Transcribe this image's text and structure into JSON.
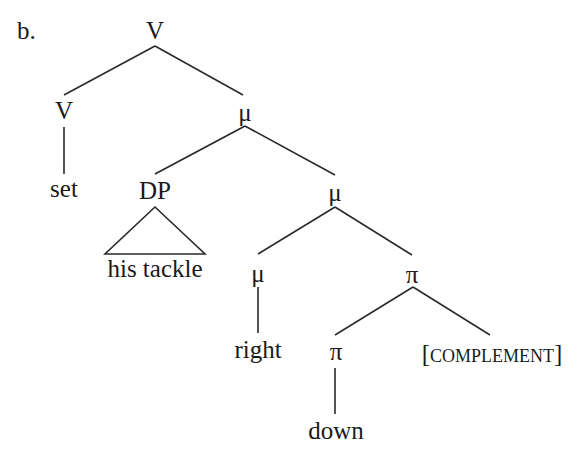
{
  "example_label": "b.",
  "tree": {
    "root": {
      "label": "V"
    },
    "v_head": {
      "label": "V",
      "word": "set"
    },
    "mu1": {
      "label": "μ"
    },
    "dp": {
      "label": "DP",
      "content": "his tackle"
    },
    "mu2": {
      "label": "μ"
    },
    "mu3": {
      "label": "μ",
      "word": "right"
    },
    "pi1": {
      "label": "π"
    },
    "pi2": {
      "label": "π",
      "word": "down"
    },
    "complement": {
      "open": "[",
      "text": "complement",
      "close": "]"
    }
  },
  "structure": "[V [V set] [μ [DP his tackle] [μ [μ right] [π [π down] [COMPLEMENT]]]]]"
}
